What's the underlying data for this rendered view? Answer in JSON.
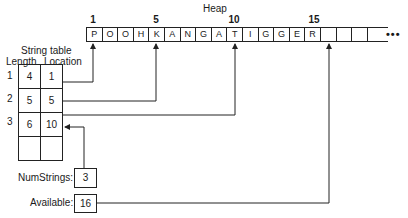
{
  "heap": {
    "title": "Heap",
    "index_labels": [
      {
        "label": "1",
        "x": 93
      },
      {
        "label": "5",
        "x": 156
      },
      {
        "label": "10",
        "x": 234
      },
      {
        "label": "15",
        "x": 314
      }
    ],
    "cells": [
      "P",
      "O",
      "O",
      "H",
      "K",
      "A",
      "N",
      "G",
      "A",
      "T",
      "I",
      "G",
      "G",
      "E",
      "R",
      "",
      "",
      ""
    ],
    "continuation": "•••"
  },
  "string_table": {
    "title": "String table",
    "columns": [
      "Length",
      "Location"
    ],
    "row_numbers": [
      "1",
      "2",
      "3"
    ],
    "rows": [
      {
        "length": "4",
        "location": "1"
      },
      {
        "length": "5",
        "location": "5"
      },
      {
        "length": "6",
        "location": "10"
      },
      {
        "length": "",
        "location": ""
      }
    ]
  },
  "num_strings": {
    "label": "NumStrings:",
    "value": "3"
  },
  "available": {
    "label": "Available:",
    "value": "16"
  },
  "colors": {
    "line": "#222222",
    "background": "#ffffff"
  }
}
